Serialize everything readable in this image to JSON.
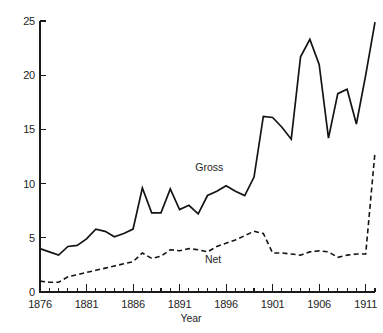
{
  "chart_data": {
    "type": "line",
    "title": "",
    "xlabel": "Year",
    "ylabel": "",
    "xlim": [
      1876,
      1912
    ],
    "ylim": [
      0,
      25
    ],
    "grid": false,
    "legend": "inline-annotation",
    "x_major_ticks": [
      1876,
      1881,
      1886,
      1891,
      1896,
      1901,
      1906,
      1911
    ],
    "x_major_tick_labels": [
      "1876",
      "1881",
      "1886",
      "1891",
      "1896",
      "1901",
      "1906",
      "1911"
    ],
    "x_minor_tick_step": 1,
    "y_ticks": [
      0,
      5,
      10,
      15,
      20,
      25
    ],
    "y_tick_labels": [
      "0",
      "5",
      "10",
      "15",
      "20",
      "25"
    ],
    "x": [
      1876,
      1877,
      1878,
      1879,
      1880,
      1881,
      1882,
      1883,
      1884,
      1885,
      1886,
      1887,
      1888,
      1889,
      1890,
      1891,
      1892,
      1893,
      1894,
      1895,
      1896,
      1897,
      1898,
      1899,
      1900,
      1901,
      1902,
      1903,
      1904,
      1905,
      1906,
      1907,
      1908,
      1909,
      1910,
      1911,
      1912
    ],
    "series": [
      {
        "name": "Gross",
        "style": "solid",
        "color": "#141414",
        "label_x": 1894.2,
        "label_y": 11.2,
        "values": [
          4.0,
          3.7,
          3.4,
          4.2,
          4.3,
          4.9,
          5.8,
          5.6,
          5.1,
          5.4,
          5.8,
          9.6,
          7.3,
          7.3,
          9.5,
          7.6,
          8.0,
          7.2,
          8.9,
          9.3,
          9.8,
          9.3,
          8.9,
          10.6,
          16.2,
          16.1,
          15.2,
          14.1,
          21.7,
          23.3,
          21.0,
          14.2,
          18.3,
          18.7,
          15.5,
          20.0,
          24.9
        ]
      },
      {
        "name": "Net",
        "style": "dashed",
        "color": "#141414",
        "label_x": 1894.6,
        "label_y": 2.7,
        "values": [
          1.0,
          0.9,
          0.9,
          1.4,
          1.6,
          1.8,
          2.0,
          2.2,
          2.4,
          2.6,
          2.8,
          3.6,
          3.1,
          3.3,
          3.9,
          3.8,
          4.0,
          3.9,
          3.7,
          4.2,
          4.5,
          4.8,
          5.2,
          5.6,
          5.4,
          3.6,
          3.6,
          3.5,
          3.4,
          3.7,
          3.8,
          3.7,
          3.2,
          3.4,
          3.5,
          3.5,
          12.9
        ]
      }
    ]
  },
  "labels": {
    "gross": "Gross",
    "net": "Net",
    "x_axis_title": "Year"
  }
}
